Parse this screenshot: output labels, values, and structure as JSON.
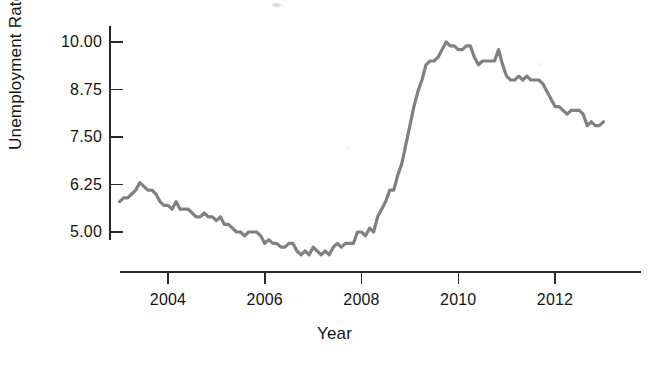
{
  "chart_data": {
    "type": "line",
    "title": "",
    "subtitle": "",
    "xlabel": "Year",
    "ylabel": "Unemployment Rate",
    "grid": false,
    "legend": false,
    "legend_position": "none",
    "line_color": "#808080",
    "axis_color": "#2a2a2a",
    "background_color": "#ffffff",
    "line_width": 3.2,
    "xlim": [
      2002.9,
      2013.1
    ],
    "ylim": [
      4.2,
      10.25
    ],
    "xticks": [
      2004,
      2006,
      2008,
      2010,
      2012
    ],
    "xtick_labels": [
      "2004",
      "2006",
      "2008",
      "2010",
      "2012"
    ],
    "yticks": [
      5.0,
      6.25,
      7.5,
      8.75,
      10.0
    ],
    "ytick_labels": [
      "5.00",
      "6.25",
      "7.50",
      "8.75",
      "10.00"
    ],
    "x_unit": "year (monthly observations)",
    "y_unit": "percent",
    "series": [
      {
        "name": "Unemployment Rate",
        "x": [
          2003.0,
          2003.083,
          2003.167,
          2003.25,
          2003.333,
          2003.417,
          2003.5,
          2003.583,
          2003.667,
          2003.75,
          2003.833,
          2003.917,
          2004.0,
          2004.083,
          2004.167,
          2004.25,
          2004.333,
          2004.417,
          2004.5,
          2004.583,
          2004.667,
          2004.75,
          2004.833,
          2004.917,
          2005.0,
          2005.083,
          2005.167,
          2005.25,
          2005.333,
          2005.417,
          2005.5,
          2005.583,
          2005.667,
          2005.75,
          2005.833,
          2005.917,
          2006.0,
          2006.083,
          2006.167,
          2006.25,
          2006.333,
          2006.417,
          2006.5,
          2006.583,
          2006.667,
          2006.75,
          2006.833,
          2006.917,
          2007.0,
          2007.083,
          2007.167,
          2007.25,
          2007.333,
          2007.417,
          2007.5,
          2007.583,
          2007.667,
          2007.75,
          2007.833,
          2007.917,
          2008.0,
          2008.083,
          2008.167,
          2008.25,
          2008.333,
          2008.417,
          2008.5,
          2008.583,
          2008.667,
          2008.75,
          2008.833,
          2008.917,
          2009.0,
          2009.083,
          2009.167,
          2009.25,
          2009.333,
          2009.417,
          2009.5,
          2009.583,
          2009.667,
          2009.75,
          2009.833,
          2009.917,
          2010.0,
          2010.083,
          2010.167,
          2010.25,
          2010.333,
          2010.417,
          2010.5,
          2010.583,
          2010.667,
          2010.75,
          2010.833,
          2010.917,
          2011.0,
          2011.083,
          2011.167,
          2011.25,
          2011.333,
          2011.417,
          2011.5,
          2011.583,
          2011.667,
          2011.75,
          2011.833,
          2011.917,
          2012.0,
          2012.083,
          2012.167,
          2012.25,
          2012.333,
          2012.417,
          2012.5,
          2012.583,
          2012.667,
          2012.75,
          2012.833,
          2012.917,
          2013.0
        ],
        "values": [
          5.8,
          5.9,
          5.9,
          6.0,
          6.1,
          6.3,
          6.2,
          6.1,
          6.1,
          6.0,
          5.8,
          5.7,
          5.7,
          5.6,
          5.8,
          5.6,
          5.6,
          5.6,
          5.5,
          5.4,
          5.4,
          5.5,
          5.4,
          5.4,
          5.3,
          5.4,
          5.2,
          5.2,
          5.1,
          5.0,
          5.0,
          4.9,
          5.0,
          5.0,
          5.0,
          4.9,
          4.7,
          4.8,
          4.7,
          4.7,
          4.6,
          4.6,
          4.7,
          4.7,
          4.5,
          4.4,
          4.5,
          4.4,
          4.6,
          4.5,
          4.4,
          4.5,
          4.4,
          4.6,
          4.7,
          4.6,
          4.7,
          4.7,
          4.7,
          5.0,
          5.0,
          4.9,
          5.1,
          5.0,
          5.4,
          5.6,
          5.8,
          6.1,
          6.1,
          6.5,
          6.8,
          7.3,
          7.8,
          8.3,
          8.7,
          9.0,
          9.4,
          9.5,
          9.5,
          9.6,
          9.8,
          10.0,
          9.9,
          9.9,
          9.8,
          9.8,
          9.9,
          9.9,
          9.6,
          9.4,
          9.5,
          9.5,
          9.5,
          9.5,
          9.8,
          9.4,
          9.1,
          9.0,
          9.0,
          9.1,
          9.0,
          9.1,
          9.0,
          9.0,
          9.0,
          8.9,
          8.7,
          8.5,
          8.3,
          8.3,
          8.2,
          8.1,
          8.2,
          8.2,
          8.2,
          8.1,
          7.8,
          7.9,
          7.8,
          7.8,
          7.9
        ]
      }
    ]
  },
  "axes": {
    "ylabel": "Unemployment Rate",
    "xlabel": "Year",
    "ytick_labels": [
      "10.00",
      "8.75",
      "7.50",
      "6.25",
      "5.00"
    ],
    "xtick_labels": [
      "2004",
      "2006",
      "2008",
      "2010",
      "2012"
    ]
  }
}
